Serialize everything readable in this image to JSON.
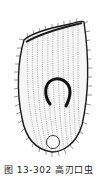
{
  "figure": {
    "style": "stippled line drawing",
    "colors": {
      "ink": "#1a1a1a",
      "background": "#ffffff"
    }
  },
  "caption": {
    "text": "图 13-302   高刃口虫"
  }
}
